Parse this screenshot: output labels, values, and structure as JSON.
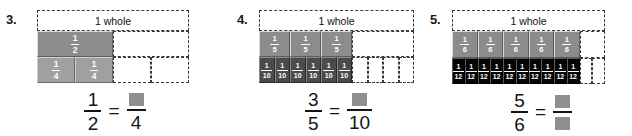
{
  "page": {
    "background": "#ffffff",
    "shade_gray": "#8c8c8c",
    "shade_dark": "#4b4b4b",
    "shade_black": "#050505",
    "blank_box_color": "#8f8f8f",
    "text_color": "#141414"
  },
  "problems": [
    {
      "number": "3.",
      "whole_label": "1 whole",
      "rows": [
        {
          "name": "halves-row",
          "cells": [
            {
              "shaded": true,
              "num": "1",
              "den": "2",
              "style": "shaded-gray",
              "size": "f-lg"
            },
            {
              "shaded": false,
              "num": "",
              "den": "",
              "style": "empty",
              "size": "f-lg"
            }
          ]
        },
        {
          "name": "fourths-row",
          "cells": [
            {
              "shaded": true,
              "num": "1",
              "den": "4",
              "style": "shaded-lightgray",
              "size": "f-lg"
            },
            {
              "shaded": true,
              "num": "1",
              "den": "4",
              "style": "shaded-lightgray",
              "size": "f-lg"
            },
            {
              "shaded": false,
              "num": "",
              "den": "",
              "style": "empty",
              "size": "f-lg"
            },
            {
              "shaded": false,
              "num": "",
              "den": "",
              "style": "empty",
              "size": "f-lg"
            }
          ]
        }
      ],
      "equation": {
        "left": {
          "num": "1",
          "den": "2"
        },
        "operator": "=",
        "right": {
          "num": "",
          "num_blank": true,
          "den": "4",
          "den_blank": false
        }
      }
    },
    {
      "number": "4.",
      "whole_label": "1 whole",
      "rows": [
        {
          "name": "fifths-row",
          "cells": [
            {
              "shaded": true,
              "num": "1",
              "den": "5",
              "style": "shaded-gray",
              "size": "f-md"
            },
            {
              "shaded": true,
              "num": "1",
              "den": "5",
              "style": "shaded-gray",
              "size": "f-md"
            },
            {
              "shaded": true,
              "num": "1",
              "den": "5",
              "style": "shaded-gray",
              "size": "f-md"
            },
            {
              "shaded": false,
              "num": "",
              "den": "",
              "style": "empty",
              "size": "f-md"
            }
          ]
        },
        {
          "name": "tenths-row",
          "cells": [
            {
              "shaded": true,
              "num": "1",
              "den": "10",
              "style": "shaded-dark",
              "size": "f-sm"
            },
            {
              "shaded": true,
              "num": "1",
              "den": "10",
              "style": "shaded-dark",
              "size": "f-sm"
            },
            {
              "shaded": true,
              "num": "1",
              "den": "10",
              "style": "shaded-dark",
              "size": "f-sm"
            },
            {
              "shaded": true,
              "num": "1",
              "den": "10",
              "style": "shaded-dark",
              "size": "f-sm"
            },
            {
              "shaded": true,
              "num": "1",
              "den": "10",
              "style": "shaded-dark",
              "size": "f-sm"
            },
            {
              "shaded": true,
              "num": "1",
              "den": "10",
              "style": "shaded-dark",
              "size": "f-sm"
            },
            {
              "shaded": false,
              "num": "",
              "den": "",
              "style": "empty",
              "size": "f-sm"
            },
            {
              "shaded": false,
              "num": "",
              "den": "",
              "style": "empty",
              "size": "f-sm"
            },
            {
              "shaded": false,
              "num": "",
              "den": "",
              "style": "empty",
              "size": "f-sm"
            },
            {
              "shaded": false,
              "num": "",
              "den": "",
              "style": "empty",
              "size": "f-sm"
            }
          ]
        }
      ],
      "equation": {
        "left": {
          "num": "3",
          "den": "5"
        },
        "operator": "=",
        "right": {
          "num": "",
          "num_blank": true,
          "den": "10",
          "den_blank": false
        }
      }
    },
    {
      "number": "5.",
      "whole_label": "1 whole",
      "rows": [
        {
          "name": "sixths-row",
          "cells": [
            {
              "shaded": true,
              "num": "1",
              "den": "6",
              "style": "shaded-gray",
              "size": "f-md"
            },
            {
              "shaded": true,
              "num": "1",
              "den": "6",
              "style": "shaded-gray",
              "size": "f-md"
            },
            {
              "shaded": true,
              "num": "1",
              "den": "6",
              "style": "shaded-gray",
              "size": "f-md"
            },
            {
              "shaded": true,
              "num": "1",
              "den": "6",
              "style": "shaded-gray",
              "size": "f-md"
            },
            {
              "shaded": true,
              "num": "1",
              "den": "6",
              "style": "shaded-gray",
              "size": "f-md"
            },
            {
              "shaded": false,
              "num": "",
              "den": "",
              "style": "empty",
              "size": "f-md"
            }
          ]
        },
        {
          "name": "twelfths-row",
          "cells": [
            {
              "shaded": true,
              "num": "1",
              "den": "12",
              "style": "shaded-black",
              "size": "f-sm"
            },
            {
              "shaded": true,
              "num": "1",
              "den": "12",
              "style": "shaded-black",
              "size": "f-sm"
            },
            {
              "shaded": true,
              "num": "1",
              "den": "12",
              "style": "shaded-black",
              "size": "f-sm"
            },
            {
              "shaded": true,
              "num": "1",
              "den": "12",
              "style": "shaded-black",
              "size": "f-sm"
            },
            {
              "shaded": true,
              "num": "1",
              "den": "12",
              "style": "shaded-black",
              "size": "f-sm"
            },
            {
              "shaded": true,
              "num": "1",
              "den": "12",
              "style": "shaded-black",
              "size": "f-sm"
            },
            {
              "shaded": true,
              "num": "1",
              "den": "12",
              "style": "shaded-black",
              "size": "f-sm"
            },
            {
              "shaded": true,
              "num": "1",
              "den": "12",
              "style": "shaded-black",
              "size": "f-sm"
            },
            {
              "shaded": true,
              "num": "1",
              "den": "12",
              "style": "shaded-black",
              "size": "f-sm"
            },
            {
              "shaded": true,
              "num": "1",
              "den": "12",
              "style": "shaded-black",
              "size": "f-sm"
            },
            {
              "shaded": false,
              "num": "",
              "den": "",
              "style": "empty",
              "size": "f-sm"
            },
            {
              "shaded": false,
              "num": "",
              "den": "",
              "style": "empty",
              "size": "f-sm"
            }
          ]
        }
      ],
      "equation": {
        "left": {
          "num": "5",
          "den": "6"
        },
        "operator": "=",
        "right": {
          "num": "",
          "num_blank": true,
          "den": "",
          "den_blank": true
        }
      }
    }
  ]
}
